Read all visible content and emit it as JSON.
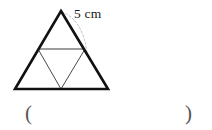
{
  "figure": {
    "type": "geometry-diagram",
    "dimension_label": "5 cm",
    "stroke_color_outer": "#111111",
    "stroke_color_inner": "#4a4a4a",
    "arc_color": "#bdbdbd",
    "background": "#ffffff",
    "outer_triangle": {
      "apex": [
        61,
        11
      ],
      "base_left": [
        15,
        89
      ],
      "base_right": [
        108,
        89
      ],
      "stroke_width": 2.6
    },
    "midsegment": {
      "start": [
        38,
        49
      ],
      "end": [
        85,
        49
      ],
      "stroke_width": 1
    },
    "inner_triangle": {
      "left": [
        38,
        49
      ],
      "right": [
        85,
        49
      ],
      "bottom": [
        61,
        89
      ],
      "stroke_width": 1
    },
    "dimension_arc": {
      "start": [
        62,
        12
      ],
      "end": [
        87,
        53
      ],
      "dash": "2 2",
      "stroke_width": 1
    }
  },
  "answer": {
    "open_paren": "(",
    "close_paren": ")"
  }
}
